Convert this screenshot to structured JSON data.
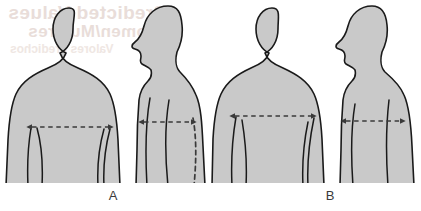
{
  "figure": {
    "background_color": "#ffffff",
    "body_fill_color": "#c9c9c9",
    "body_outline_color": "#1a1a1a",
    "arrow_color": "#3a3a3a",
    "label_color": "#3b3b3b",
    "width": 421,
    "height": 211
  },
  "bleed_through_text": {
    "note": "faint mirrored show-through from reverse side of page",
    "color": "#e8dcd8",
    "line1": "Predicted Values",
    "line2": "Women/Mujeres",
    "line3": "Valores predichos"
  },
  "panels": [
    {
      "id": "A",
      "label": "A",
      "views": [
        {
          "id": "a-front",
          "name": "front-view",
          "measurement": {
            "orientation": "horizontal",
            "style": "dashed",
            "arrowheads": "both",
            "x_start": 30,
            "x_end": 110,
            "y": 127
          }
        },
        {
          "id": "a-side",
          "name": "side-view",
          "measurement": {
            "orientation": "horizontal",
            "style": "dashed",
            "arrowheads": "both",
            "x_start": 142,
            "x_end": 193,
            "y": 122
          },
          "guide_line": {
            "orientation": "vertical",
            "style": "dashed",
            "description": "posterior spine reference line"
          }
        }
      ]
    },
    {
      "id": "B",
      "label": "B",
      "views": [
        {
          "id": "b-front",
          "name": "front-view",
          "measurement": {
            "orientation": "horizontal",
            "style": "dashed",
            "arrowheads": "both",
            "x_start": 233,
            "x_end": 313,
            "y": 116
          }
        },
        {
          "id": "b-side",
          "name": "side-view",
          "measurement": {
            "orientation": "horizontal",
            "style": "dashed",
            "arrowheads": "both",
            "x_start": 344,
            "x_end": 402,
            "y": 121
          },
          "guide_line": {
            "orientation": "vertical",
            "style": "solid",
            "description": "anterior and posterior reference lines"
          }
        }
      ]
    }
  ]
}
